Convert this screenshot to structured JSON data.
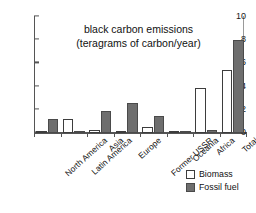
{
  "chart_data": {
    "type": "bar",
    "title": "black carbon emissions (teragrams of carbon/year)",
    "title_lines": [
      "black carbon emissions",
      "(teragrams of carbon/year)"
    ],
    "xlabel": "",
    "ylabel": "",
    "ylim": [
      0,
      10
    ],
    "yticks": [
      0,
      2,
      4,
      6,
      8,
      10
    ],
    "ytick_labels": [
      "0",
      "2",
      "4",
      "6",
      "8",
      "10"
    ],
    "grid": false,
    "legend_position": "bottom-right",
    "categories": [
      "North America",
      "Latin America",
      "Asia",
      "Europe",
      "Former USSR",
      "Oceania",
      "Africa",
      "Total"
    ],
    "series": [
      {
        "name": "Biomass",
        "color": "#ffffff",
        "edge_color": "#3d3d3d",
        "values": [
          0.1,
          1.2,
          0.3,
          0.05,
          0.5,
          0.15,
          3.9,
          5.4
        ]
      },
      {
        "name": "Fossil fuel",
        "color": "#6e6e6e",
        "edge_color": "#4a4a4a",
        "values": [
          1.2,
          0.1,
          1.9,
          2.6,
          1.5,
          0.1,
          0.3,
          8.0
        ]
      }
    ]
  },
  "legend": {
    "items": [
      {
        "label": "Biomass",
        "swatch": "biomass-swatch"
      },
      {
        "label": "Fossil fuel",
        "swatch": "fossil-fuel-swatch"
      }
    ]
  },
  "colors": {
    "axis": "#555555",
    "text": "#111111",
    "biomass": "#ffffff",
    "fossil_fuel": "#6e6e6e",
    "background": "#ffffff"
  }
}
